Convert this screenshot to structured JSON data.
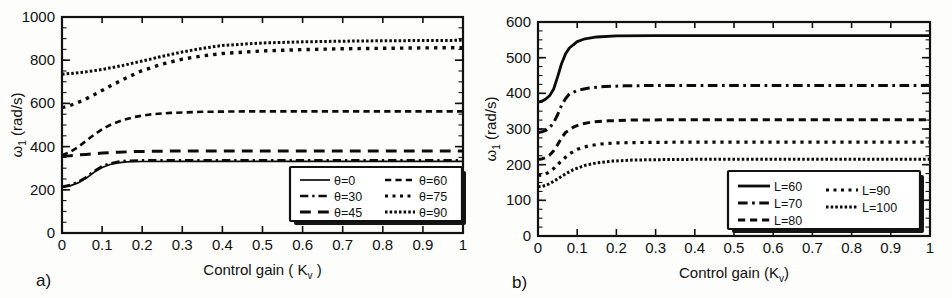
{
  "figure": {
    "background_color": "#fdfdfc",
    "line_color": "#0b0b0b",
    "text_color": "#111111"
  },
  "panel_a": {
    "label": "a)",
    "xlabel_main": "Control gain ( K",
    "xlabel_sub": "v",
    "xlabel_close": " )",
    "ylabel_main": "ω",
    "ylabel_sub": "1",
    "ylabel_units": " (rad/s)",
    "legend": {
      "column_1": [
        "θ=0",
        "θ=30",
        "θ=45"
      ],
      "column_2": [
        "θ=60",
        "θ=75",
        "θ=90"
      ]
    }
  },
  "panel_b": {
    "label": "b)",
    "xlabel_main": "Control gain (K",
    "xlabel_sub": "v",
    "xlabel_close": ")",
    "ylabel_main": "ω",
    "ylabel_sub": "1",
    "ylabel_units": " (rad/s)",
    "legend": {
      "column_1": [
        "L=60",
        "L=70",
        "L=80"
      ],
      "column_2": [
        "L=90",
        "L=100"
      ]
    }
  },
  "chart_data": [
    {
      "id": "panel-a",
      "type": "line",
      "title": "",
      "panel_label": "a)",
      "xlabel": "Control gain ( K_v )",
      "ylabel": "ω_1 (rad/s)",
      "xlim": [
        0,
        1
      ],
      "ylim": [
        0,
        1000
      ],
      "xticks": [
        0,
        0.1,
        0.2,
        0.3,
        0.4,
        0.5,
        0.6,
        0.7,
        0.8,
        0.9,
        1
      ],
      "xticklabels": [
        "0",
        "0.1",
        "0.2",
        "0.3",
        "0.4",
        "0.5",
        "0.6",
        "0.7",
        "0.8",
        "0.9",
        "1"
      ],
      "yticks": [
        0,
        200,
        400,
        600,
        800,
        1000
      ],
      "yticklabels": [
        "0",
        "200",
        "400",
        "600",
        "800",
        "1000"
      ],
      "y_minor_step": 50,
      "grid": false,
      "legend_position": "lower-right",
      "series": [
        {
          "name": "θ=0",
          "dash": "solid",
          "width": 1.7,
          "x": [
            0,
            0.02,
            0.04,
            0.06,
            0.08,
            0.1,
            0.12,
            0.14,
            0.16,
            0.2,
            0.3,
            0.4,
            0.5,
            0.6,
            0.7,
            0.8,
            0.9,
            1.0
          ],
          "values": [
            210,
            218,
            232,
            253,
            281,
            303,
            317,
            325,
            329,
            331,
            332,
            332,
            332,
            332,
            332,
            332,
            332,
            332
          ]
        },
        {
          "name": "θ=30",
          "dash": "dashdot",
          "width": 2.6,
          "x": [
            0,
            0.02,
            0.04,
            0.06,
            0.08,
            0.1,
            0.12,
            0.14,
            0.16,
            0.2,
            0.3,
            0.4,
            0.5,
            0.6,
            0.7,
            0.8,
            0.9,
            1.0
          ],
          "values": [
            214,
            222,
            236,
            258,
            286,
            309,
            322,
            330,
            334,
            336,
            337,
            337,
            337,
            337,
            337,
            337,
            337,
            337
          ]
        },
        {
          "name": "θ=45",
          "dash": "longdash",
          "width": 3.0,
          "x": [
            0,
            0.02,
            0.04,
            0.06,
            0.08,
            0.1,
            0.14,
            0.18,
            0.25,
            0.35,
            0.5,
            0.65,
            0.8,
            0.9,
            1.0
          ],
          "values": [
            356,
            358,
            361,
            364,
            367,
            370,
            374,
            377,
            379,
            380,
            380,
            380,
            380,
            380,
            380
          ]
        },
        {
          "name": "θ=60",
          "dash": "dashed",
          "width": 2.6,
          "x": [
            0,
            0.02,
            0.04,
            0.06,
            0.08,
            0.1,
            0.12,
            0.15,
            0.18,
            0.22,
            0.27,
            0.35,
            0.45,
            0.6,
            0.75,
            0.9,
            1.0
          ],
          "values": [
            360,
            375,
            398,
            426,
            455,
            480,
            500,
            522,
            537,
            549,
            556,
            561,
            563,
            563,
            563,
            563,
            563
          ]
        },
        {
          "name": "θ=75",
          "dash": "dotted-wide",
          "width": 3.4,
          "x": [
            0,
            0.02,
            0.05,
            0.08,
            0.12,
            0.16,
            0.2,
            0.25,
            0.3,
            0.35,
            0.4,
            0.5,
            0.6,
            0.7,
            0.8,
            0.9,
            1.0
          ],
          "values": [
            580,
            590,
            612,
            640,
            680,
            718,
            752,
            782,
            805,
            820,
            831,
            843,
            849,
            853,
            855,
            857,
            858
          ]
        },
        {
          "name": "θ=90",
          "dash": "dotted-fine",
          "width": 3.0,
          "x": [
            0,
            0.03,
            0.06,
            0.1,
            0.15,
            0.2,
            0.25,
            0.3,
            0.35,
            0.4,
            0.5,
            0.6,
            0.7,
            0.8,
            0.9,
            1.0
          ],
          "values": [
            735,
            740,
            746,
            757,
            775,
            796,
            818,
            838,
            855,
            868,
            880,
            885,
            888,
            890,
            891,
            892
          ]
        }
      ]
    },
    {
      "id": "panel-b",
      "type": "line",
      "title": "",
      "panel_label": "b)",
      "xlabel": "Control gain (K_v)",
      "ylabel": "ω_1 (rad/s)",
      "xlim": [
        0,
        1
      ],
      "ylim": [
        0,
        600
      ],
      "xticks": [
        0,
        0.1,
        0.2,
        0.3,
        0.4,
        0.5,
        0.6,
        0.7,
        0.8,
        0.9,
        1
      ],
      "xticklabels": [
        "0",
        "0.1",
        "0.2",
        "0.3",
        "0.4",
        "0.5",
        "0.6",
        "0.7",
        "0.8",
        "0.9",
        "1"
      ],
      "yticks": [
        0,
        100,
        200,
        300,
        400,
        500,
        600
      ],
      "yticklabels": [
        "0",
        "100",
        "200",
        "300",
        "400",
        "500",
        "600"
      ],
      "y_minor_step": 25,
      "grid": false,
      "legend_position": "lower-right",
      "series": [
        {
          "name": "L=60",
          "dash": "solid",
          "width": 2.8,
          "x": [
            0,
            0.01,
            0.02,
            0.03,
            0.04,
            0.05,
            0.06,
            0.07,
            0.08,
            0.1,
            0.12,
            0.15,
            0.2,
            0.3,
            0.5,
            0.7,
            0.9,
            1.0
          ],
          "values": [
            375,
            378,
            384,
            394,
            412,
            446,
            483,
            510,
            527,
            545,
            553,
            558,
            561,
            562,
            562,
            562,
            562,
            562
          ]
        },
        {
          "name": "L=70",
          "dash": "dashdot",
          "width": 3.0,
          "x": [
            0,
            0.01,
            0.02,
            0.03,
            0.04,
            0.05,
            0.06,
            0.07,
            0.08,
            0.1,
            0.13,
            0.17,
            0.22,
            0.3,
            0.5,
            0.7,
            0.9,
            1.0
          ],
          "values": [
            290,
            292,
            296,
            304,
            318,
            340,
            366,
            385,
            398,
            408,
            415,
            419,
            421,
            422,
            422,
            422,
            422,
            422
          ]
        },
        {
          "name": "L=80",
          "dash": "dashed",
          "width": 3.0,
          "x": [
            0,
            0.01,
            0.02,
            0.03,
            0.04,
            0.05,
            0.06,
            0.07,
            0.09,
            0.11,
            0.14,
            0.18,
            0.24,
            0.35,
            0.55,
            0.75,
            0.9,
            1.0
          ],
          "values": [
            215,
            216,
            220,
            227,
            239,
            256,
            275,
            290,
            305,
            314,
            320,
            323,
            325,
            326,
            326,
            326,
            326,
            326
          ]
        },
        {
          "name": "L=90",
          "dash": "dotted-wide",
          "width": 3.2,
          "x": [
            0,
            0.01,
            0.02,
            0.03,
            0.04,
            0.06,
            0.08,
            0.1,
            0.13,
            0.16,
            0.2,
            0.25,
            0.35,
            0.55,
            0.75,
            0.9,
            1.0
          ],
          "values": [
            170,
            171,
            174,
            180,
            189,
            211,
            230,
            243,
            253,
            258,
            261,
            262,
            263,
            263,
            263,
            263,
            263
          ]
        },
        {
          "name": "L=100",
          "dash": "dotted-fine",
          "width": 3.0,
          "x": [
            0,
            0.01,
            0.02,
            0.03,
            0.05,
            0.07,
            0.09,
            0.12,
            0.15,
            0.19,
            0.24,
            0.3,
            0.4,
            0.6,
            0.8,
            0.9,
            1.0
          ],
          "values": [
            138,
            139,
            142,
            147,
            160,
            174,
            186,
            198,
            205,
            210,
            213,
            214,
            215,
            215,
            215,
            215,
            215
          ]
        }
      ]
    }
  ]
}
